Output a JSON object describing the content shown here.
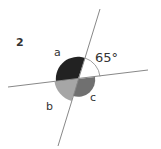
{
  "diagram": {
    "number": "2",
    "angles": {
      "a": "a",
      "b": "b",
      "c": "c",
      "given": "65°"
    },
    "colors": {
      "a": "#222222",
      "b": "#a6a6a6",
      "c": "#707070",
      "line": "#888888",
      "arc": "#888888",
      "text": "#333333"
    }
  }
}
